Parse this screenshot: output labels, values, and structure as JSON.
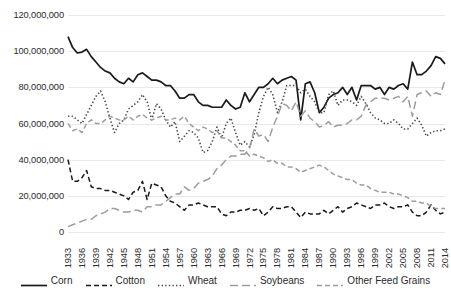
{
  "chart_data": {
    "type": "line",
    "title": "",
    "xlabel": "",
    "ylabel": "",
    "ylim": [
      0,
      120000000
    ],
    "y_ticks": [
      0,
      20000000,
      40000000,
      60000000,
      80000000,
      100000000,
      120000000
    ],
    "y_tick_labels": [
      "0",
      "20,000,000",
      "40,000,000",
      "60,000,000",
      "80,000,000",
      "100,000,000",
      "120,000,000"
    ],
    "grid": true,
    "grid_axis": "y",
    "legend_position": "bottom",
    "x_tick_labels": [
      "1933",
      "1936",
      "1939",
      "1942",
      "1945",
      "1948",
      "1951",
      "1954",
      "1957",
      "1960",
      "1963",
      "1966",
      "1969",
      "1972",
      "1975",
      "1978",
      "1981",
      "1984",
      "1987",
      "1990",
      "1993",
      "1996",
      "1999",
      "2002",
      "2005",
      "2008",
      "2011",
      "2014"
    ],
    "x": [
      1933,
      1934,
      1935,
      1936,
      1937,
      1938,
      1939,
      1940,
      1941,
      1942,
      1943,
      1944,
      1945,
      1946,
      1947,
      1948,
      1949,
      1950,
      1951,
      1952,
      1953,
      1954,
      1955,
      1956,
      1957,
      1958,
      1959,
      1960,
      1961,
      1962,
      1963,
      1964,
      1965,
      1966,
      1967,
      1968,
      1969,
      1970,
      1971,
      1972,
      1973,
      1974,
      1975,
      1976,
      1977,
      1978,
      1979,
      1980,
      1981,
      1982,
      1983,
      1984,
      1985,
      1986,
      1987,
      1988,
      1989,
      1990,
      1991,
      1992,
      1993,
      1994,
      1995,
      1996,
      1997,
      1998,
      1999,
      2000,
      2001,
      2002,
      2003,
      2004,
      2005,
      2006,
      2007,
      2008,
      2009,
      2010,
      2011,
      2012,
      2013,
      2014
    ],
    "series": [
      {
        "name": "Corn",
        "color": "#1a1a1a",
        "style": "solid",
        "values": [
          108000000,
          102000000,
          99000000,
          99500000,
          101000000,
          97000000,
          94000000,
          91000000,
          89000000,
          88000000,
          85000000,
          83000000,
          82000000,
          85000000,
          83000000,
          87000000,
          88000000,
          86000000,
          84000000,
          84000000,
          83000000,
          81000000,
          81000000,
          78000000,
          74000000,
          74000000,
          76000000,
          76000000,
          72000000,
          70000000,
          70000000,
          69000000,
          69000000,
          69000000,
          73000000,
          70000000,
          68000000,
          69000000,
          77000000,
          72000000,
          76000000,
          80000000,
          80000000,
          82000000,
          85000000,
          82000000,
          84000000,
          85000000,
          86000000,
          84000000,
          62000000,
          82000000,
          83000000,
          77000000,
          66000000,
          69000000,
          74000000,
          76000000,
          77000000,
          80000000,
          76000000,
          80000000,
          73000000,
          81000000,
          81000000,
          81000000,
          79000000,
          80000000,
          76000000,
          80000000,
          79000000,
          81000000,
          82000000,
          79000000,
          94000000,
          87000000,
          87000000,
          89000000,
          92000000,
          97000000,
          96000000,
          93000000
        ]
      },
      {
        "name": "Cotton",
        "color": "#1a1a1a",
        "style": "dashed",
        "values": [
          40000000,
          28000000,
          28000000,
          30000000,
          34000000,
          25000000,
          24000000,
          24000000,
          23000000,
          23000000,
          22000000,
          21000000,
          20000000,
          18000000,
          22000000,
          23000000,
          28000000,
          18000000,
          27000000,
          26000000,
          25000000,
          20000000,
          17000000,
          16000000,
          14000000,
          12000000,
          15000000,
          15000000,
          16000000,
          15000000,
          14000000,
          14000000,
          14000000,
          10000000,
          9000000,
          11000000,
          11000000,
          12000000,
          12000000,
          13000000,
          12000000,
          13000000,
          9000000,
          11000000,
          14000000,
          13000000,
          13000000,
          14000000,
          14000000,
          11000000,
          8000000,
          11000000,
          10000000,
          10000000,
          10000000,
          12000000,
          10000000,
          12000000,
          14000000,
          11000000,
          13000000,
          14000000,
          16000000,
          15000000,
          14000000,
          13000000,
          15000000,
          15000000,
          16000000,
          14000000,
          13000000,
          14000000,
          14000000,
          15000000,
          11000000,
          9000000,
          9000000,
          11000000,
          15000000,
          12000000,
          10000000,
          11000000
        ]
      },
      {
        "name": "Wheat",
        "color": "#4a4a4a",
        "style": "dotted",
        "values": [
          64000000,
          64000000,
          62000000,
          60000000,
          65000000,
          70000000,
          75000000,
          78000000,
          72000000,
          63000000,
          55000000,
          60000000,
          62000000,
          68000000,
          70000000,
          72000000,
          76000000,
          72000000,
          62000000,
          71000000,
          68000000,
          62000000,
          58000000,
          61000000,
          50000000,
          53000000,
          56000000,
          55000000,
          52000000,
          44000000,
          45000000,
          50000000,
          58000000,
          52000000,
          60000000,
          63000000,
          55000000,
          48000000,
          50000000,
          47000000,
          54000000,
          66000000,
          75000000,
          80000000,
          76000000,
          66000000,
          72000000,
          81000000,
          81000000,
          81000000,
          77000000,
          79000000,
          75000000,
          72000000,
          66000000,
          66000000,
          76000000,
          78000000,
          70000000,
          73000000,
          73000000,
          72000000,
          70000000,
          75000000,
          71000000,
          66000000,
          63000000,
          62000000,
          60000000,
          60000000,
          62000000,
          60000000,
          57000000,
          57000000,
          60000000,
          63000000,
          59000000,
          53000000,
          55000000,
          56000000,
          56000000,
          57000000
        ]
      },
      {
        "name": "Soybeans",
        "color": "#9d9d9d",
        "style": "longdash",
        "values": [
          3000000,
          4000000,
          5000000,
          6000000,
          7000000,
          7000000,
          9000000,
          10000000,
          11000000,
          13000000,
          13000000,
          12000000,
          11000000,
          11000000,
          12000000,
          12000000,
          11000000,
          14000000,
          14000000,
          15000000,
          15000000,
          17000000,
          19000000,
          21000000,
          21000000,
          25000000,
          23000000,
          24000000,
          27000000,
          28000000,
          29000000,
          31000000,
          35000000,
          37000000,
          40000000,
          42000000,
          42000000,
          43000000,
          43000000,
          46000000,
          57000000,
          53000000,
          54000000,
          50000000,
          58000000,
          64000000,
          71000000,
          70000000,
          67000000,
          72000000,
          64000000,
          67000000,
          63000000,
          61000000,
          58000000,
          59000000,
          61000000,
          58000000,
          59000000,
          59000000,
          60000000,
          62000000,
          62000000,
          64000000,
          70000000,
          72000000,
          74000000,
          74000000,
          74000000,
          73000000,
          74000000,
          75000000,
          72000000,
          75000000,
          64000000,
          76000000,
          77000000,
          78000000,
          75000000,
          77000000,
          76000000,
          84000000
        ]
      },
      {
        "name": "Other Feed Grains",
        "color": "#9d9d9d",
        "style": "dashed",
        "values": [
          60000000,
          56000000,
          57000000,
          55000000,
          60000000,
          62000000,
          60000000,
          60000000,
          62000000,
          64000000,
          63000000,
          62000000,
          62000000,
          64000000,
          62000000,
          64000000,
          65000000,
          63000000,
          62000000,
          63000000,
          64000000,
          62000000,
          62000000,
          63000000,
          62000000,
          64000000,
          60000000,
          58000000,
          56000000,
          58000000,
          57000000,
          55000000,
          56000000,
          52000000,
          52000000,
          50000000,
          48000000,
          45000000,
          45000000,
          42000000,
          43000000,
          42000000,
          41000000,
          39000000,
          40000000,
          38000000,
          38000000,
          36000000,
          36000000,
          35000000,
          33000000,
          34000000,
          35000000,
          36000000,
          37000000,
          36000000,
          34000000,
          32000000,
          31000000,
          30000000,
          29000000,
          29000000,
          27000000,
          26000000,
          26000000,
          24000000,
          23000000,
          22000000,
          22000000,
          22000000,
          21000000,
          21000000,
          20000000,
          19000000,
          17000000,
          17000000,
          16000000,
          16000000,
          14000000,
          13000000,
          13000000,
          13000000
        ]
      }
    ]
  }
}
